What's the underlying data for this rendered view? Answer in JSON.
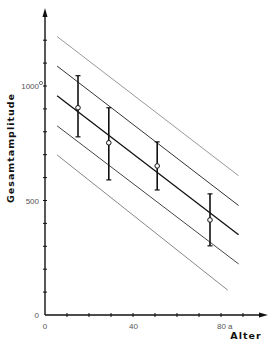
{
  "chart_data": {
    "type": "scatter",
    "title": "",
    "xlabel": "Alter",
    "ylabel": "Gesamtamplitude",
    "x_unit": "a",
    "xlim": [
      0,
      100
    ],
    "ylim": [
      0,
      1250
    ],
    "x_ticks": [
      0,
      10,
      20,
      30,
      40,
      50,
      60,
      70,
      80,
      90
    ],
    "x_tick_labels": [
      {
        "value": 0,
        "label": "0"
      },
      {
        "value": 40,
        "label": "40"
      },
      {
        "value": 80,
        "label": "80 a"
      }
    ],
    "y_ticks": [
      0,
      100,
      200,
      300,
      400,
      500,
      600,
      700,
      800,
      900,
      1000,
      1100,
      1200
    ],
    "y_tick_labels": [
      {
        "value": 0,
        "label": "0"
      },
      {
        "value": 500,
        "label": "500"
      },
      {
        "value": 1000,
        "label": "1000"
      }
    ],
    "grid": false,
    "series": [
      {
        "name": "Mittelwerte mit Streuung",
        "kind": "errorbar",
        "points": [
          {
            "x": 15,
            "y": 905,
            "low": 778,
            "high": 1045
          },
          {
            "x": 29,
            "y": 752,
            "low": 590,
            "high": 905
          },
          {
            "x": 51,
            "y": 651,
            "low": 546,
            "high": 756
          },
          {
            "x": 75,
            "y": 415,
            "low": 302,
            "high": 529
          }
        ]
      },
      {
        "name": "Regressionsgerade und Grenzlinien",
        "kind": "lines",
        "lines": [
          {
            "label": "+2s",
            "x": [
              5.5,
              88
            ],
            "y": [
              1216,
              608
            ],
            "color": "#999999"
          },
          {
            "label": "+1s",
            "x": [
              5.5,
              88
            ],
            "y": [
              1087,
              478
            ],
            "color": "#333333"
          },
          {
            "label": "mean",
            "x": [
              5.5,
              88
            ],
            "y": [
              957,
              350
            ],
            "color": "#111111"
          },
          {
            "label": "-1s",
            "x": [
              5.5,
              88
            ],
            "y": [
              826,
              223
            ],
            "color": "#444444"
          },
          {
            "label": "-2s",
            "x": [
              5.5,
              83
            ],
            "y": [
              699,
              109
            ],
            "color": "#888888"
          }
        ]
      }
    ]
  }
}
